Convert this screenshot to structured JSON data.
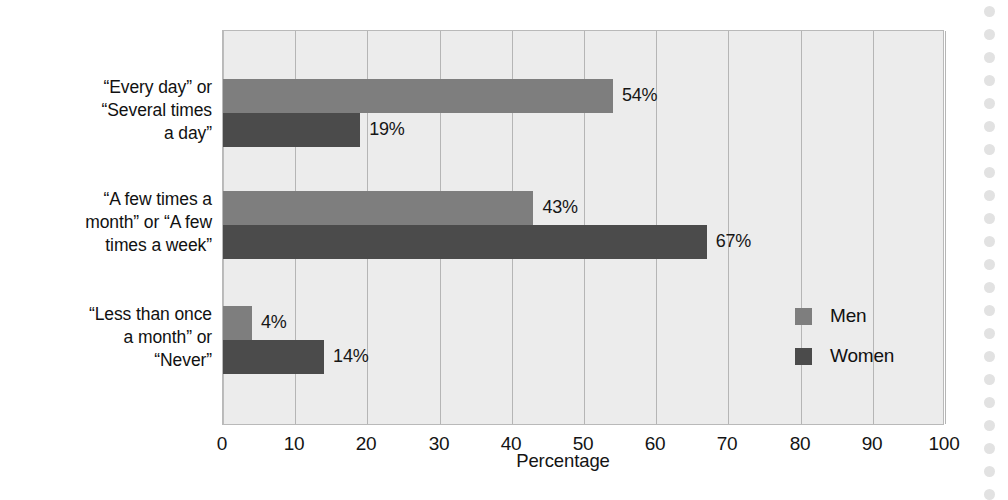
{
  "chart_data": {
    "type": "bar",
    "orientation": "horizontal",
    "title": "",
    "xlabel": "Percentage",
    "ylabel": "",
    "xlim": [
      0,
      100
    ],
    "xticks": [
      "0",
      "10",
      "20",
      "30",
      "40",
      "50",
      "60",
      "70",
      "80",
      "90",
      "100"
    ],
    "grid": "vertical",
    "legend_position": "inside-right",
    "categories": [
      "“Every day” or\n“Several times\na day”",
      "“A few times a\nmonth” or “A few\ntimes a week”",
      "“Less than once\na month” or\n“Never”"
    ],
    "series": [
      {
        "name": "Men",
        "color": "#7e7e7e",
        "values": [
          54,
          43,
          4
        ],
        "value_labels": [
          "54%",
          "43%",
          "4%"
        ]
      },
      {
        "name": "Women",
        "color": "#4b4b4b",
        "values": [
          19,
          67,
          14
        ],
        "value_labels": [
          "19%",
          "67%",
          "14%"
        ]
      }
    ]
  },
  "legend": {
    "items": [
      {
        "label": "Men",
        "color": "#7e7e7e"
      },
      {
        "label": "Women",
        "color": "#4b4b4b"
      }
    ]
  },
  "axis": {
    "x_title": "Percentage"
  },
  "colors": {
    "men": "#7e7e7e",
    "women": "#4b4b4b",
    "plot_background": "#ececec",
    "gridline": "#b5b5b5",
    "frame": "#b9b9b9",
    "text": "#111111"
  }
}
